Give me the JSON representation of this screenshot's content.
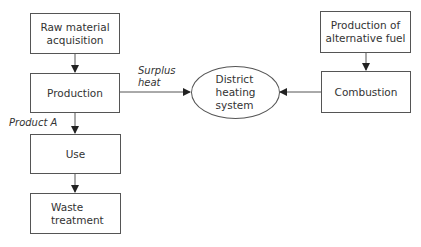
{
  "nodes": {
    "raw_material": {
      "label": "Raw material\nacquisition"
    },
    "production": {
      "label": "Production"
    },
    "use": {
      "label": "Use"
    },
    "waste_treatment": {
      "label": "Waste\ntreatment"
    },
    "district_heating": {
      "label": "District\nheating\nsystem"
    },
    "alternative_fuel": {
      "label": "Production of\nalternative fuel"
    },
    "combustion": {
      "label": "Combustion"
    }
  },
  "edge_labels": {
    "surplus_heat": "Surplus\nheat",
    "product_a": "Product A"
  },
  "colors": {
    "stroke": "#555555",
    "text": "#333333",
    "background": "#ffffff"
  }
}
